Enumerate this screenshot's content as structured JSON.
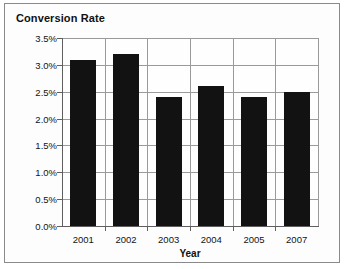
{
  "chart": {
    "title": "Conversion Rate"
  },
  "chart_data": {
    "type": "bar",
    "title": "Conversion Rate",
    "xlabel": "Year",
    "ylabel": "",
    "categories": [
      "2001",
      "2002",
      "2003",
      "2004",
      "2005",
      "2007"
    ],
    "values": [
      3.1,
      3.2,
      2.4,
      2.6,
      2.4,
      2.5
    ],
    "value_unit": "%",
    "ylim": [
      0.0,
      3.5
    ],
    "ytick_labels": [
      "0.0%",
      "0.5%",
      "1.0%",
      "1.5%",
      "2.0%",
      "2.5%",
      "3.0%",
      "3.5%"
    ],
    "ytick_values": [
      0.0,
      0.5,
      1.0,
      1.5,
      2.0,
      2.5,
      3.0,
      3.5
    ],
    "grid": true,
    "grid_axis": "both",
    "legend": false,
    "bar_color": "#121212",
    "grid_color": "#9a9a9a",
    "axis_color": "#5f5f5f",
    "background_color": "#fefefe"
  }
}
